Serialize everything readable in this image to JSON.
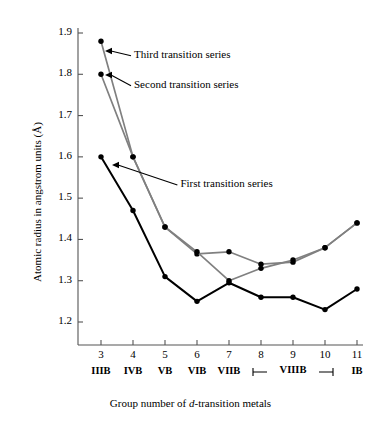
{
  "chart_data": {
    "type": "line",
    "title": "",
    "xlabel": "Group number of d-transition metals",
    "ylabel": "Atomic radius in angstrom units (Å)",
    "x": [
      3,
      4,
      5,
      6,
      7,
      8,
      9,
      10,
      11
    ],
    "xtick_labels": [
      "3",
      "4",
      "5",
      "6",
      "7",
      "8",
      "9",
      "10",
      "11"
    ],
    "group_labels": [
      "IIIB",
      "IVB",
      "VB",
      "VIB",
      "VIIB",
      "",
      "",
      "",
      "IB"
    ],
    "viiib_label": "VIIIB",
    "viiib_span": [
      8,
      10
    ],
    "xlim": [
      2.5,
      11.4
    ],
    "ylim": [
      1.14,
      1.935
    ],
    "ytick_labels": [
      "1.2",
      "1.3",
      "1.4",
      "1.5",
      "1.6",
      "1.7",
      "1.8",
      "1.9"
    ],
    "yticks": [
      1.2,
      1.3,
      1.4,
      1.5,
      1.6,
      1.7,
      1.8,
      1.9
    ],
    "grid": false,
    "legend_position": "annotations-inline",
    "series": [
      {
        "name": "First transition series",
        "color": "#000000",
        "values": [
          1.6,
          1.47,
          1.31,
          1.25,
          1.295,
          1.26,
          1.26,
          1.23,
          1.28
        ]
      },
      {
        "name": "Second transition series",
        "color": "#808080",
        "values": [
          1.8,
          1.6,
          1.43,
          1.365,
          1.37,
          1.34,
          1.345,
          1.38,
          1.44
        ]
      },
      {
        "name": "Third transition series",
        "color": "#808080",
        "values": [
          1.88,
          1.6,
          1.43,
          1.37,
          1.3,
          1.33,
          1.35,
          1.38,
          1.44
        ]
      }
    ],
    "annotations": [
      {
        "text": "Third transition series",
        "x": 4.0,
        "y": 1.845
      },
      {
        "text": "Second transition series",
        "x": 4.0,
        "y": 1.772
      },
      {
        "text": "First transition series",
        "x": 5.45,
        "y": 1.532
      }
    ]
  }
}
